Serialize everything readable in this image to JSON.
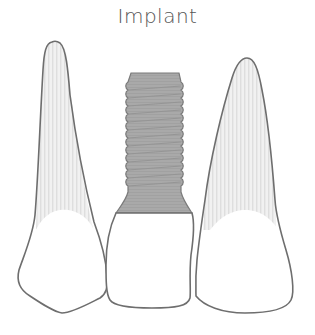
{
  "title": "Implant",
  "diagram": {
    "teeth": [
      {
        "id": "left-natural-tooth",
        "type": "natural"
      },
      {
        "id": "implant-crown",
        "type": "implant"
      },
      {
        "id": "right-natural-tooth",
        "type": "natural"
      }
    ]
  },
  "colors": {
    "outline": "#6e6e6e",
    "root_fill": "#eeeeee",
    "root_stripe": "#dcdcdc",
    "implant_fill": "#a8a8a8",
    "implant_thread": "#8f8f8f",
    "crown_fill": "#ffffff"
  }
}
